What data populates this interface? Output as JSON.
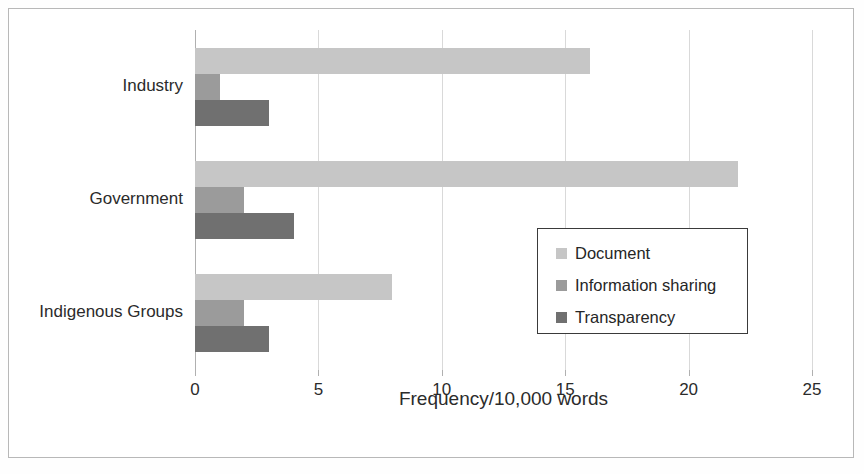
{
  "chart_data": {
    "type": "bar",
    "orientation": "horizontal",
    "title": "",
    "xlabel": "Frequency/10,000 words",
    "ylabel": "",
    "xlim": [
      0,
      25
    ],
    "xticks": [
      0,
      5,
      10,
      15,
      20,
      25
    ],
    "xtick_labels": [
      "0",
      "5",
      "10",
      "15",
      "20",
      "25"
    ],
    "grid": true,
    "grid_axis": "x",
    "legend_position": "center-right",
    "categories": [
      "Industry",
      "Government",
      "Indigenous Groups"
    ],
    "series": [
      {
        "name": "Document",
        "color": "#c6c6c6",
        "values": [
          16,
          22,
          8
        ]
      },
      {
        "name": "Information sharing",
        "color": "#9b9b9b",
        "values": [
          1,
          2,
          2
        ]
      },
      {
        "name": "Transparency",
        "color": "#707070",
        "values": [
          3,
          4,
          3
        ]
      }
    ]
  }
}
